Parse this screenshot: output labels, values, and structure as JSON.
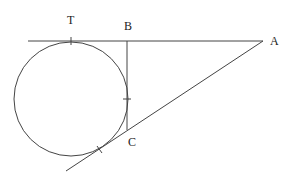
{
  "diagram": {
    "type": "geometry",
    "labels": {
      "T": "T",
      "B": "B",
      "A": "A",
      "C": "C"
    },
    "stroke_color": "#444444",
    "points": {
      "T": [
        71,
        41
      ],
      "B": [
        127,
        41
      ],
      "A": [
        263,
        41
      ],
      "C": [
        127,
        130
      ]
    },
    "circle": {
      "cx": 71,
      "cy": 99,
      "r": 57
    }
  }
}
